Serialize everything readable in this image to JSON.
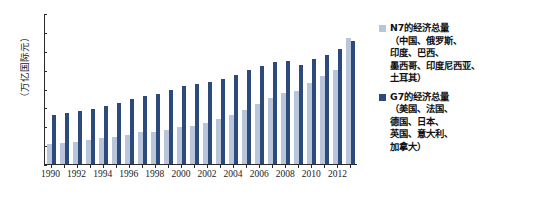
{
  "chart_data": {
    "type": "bar",
    "title": "",
    "xlabel": "",
    "ylabel": "（万亿国际元）",
    "ylim": [
      0,
      4.0
    ],
    "yticks": [
      "0",
      "0.5",
      "1.0",
      "1.5",
      "2.0",
      "2.5",
      "3.0",
      "3.5",
      "4.0"
    ],
    "ytick_values": [
      0,
      0.5,
      1.0,
      1.5,
      2.0,
      2.5,
      3.0,
      3.5,
      4.0
    ],
    "grid": false,
    "legend_position": "right",
    "categories": [
      "1990",
      "1991",
      "1992",
      "1993",
      "1994",
      "1995",
      "1996",
      "1997",
      "1998",
      "1999",
      "2000",
      "2001",
      "2002",
      "2003",
      "2004",
      "2005",
      "2006",
      "2007",
      "2008",
      "2009",
      "2010",
      "2011",
      "2012",
      "2013"
    ],
    "xtick_labels": [
      "1990",
      "1992",
      "1994",
      "1996",
      "1998",
      "2000",
      "2002",
      "2004",
      "2006",
      "2008",
      "2010",
      "2012"
    ],
    "series": [
      {
        "name": "N7的经济总量",
        "color": "#b9c5da",
        "values": [
          0.54,
          0.56,
          0.58,
          0.63,
          0.68,
          0.72,
          0.78,
          0.84,
          0.86,
          0.9,
          0.97,
          1.02,
          1.09,
          1.18,
          1.3,
          1.43,
          1.59,
          1.76,
          1.88,
          1.94,
          2.15,
          2.32,
          2.48,
          3.35
        ]
      },
      {
        "name": "G7的经济总量",
        "color": "#2c4a7c",
        "values": [
          1.3,
          1.35,
          1.41,
          1.46,
          1.54,
          1.62,
          1.71,
          1.79,
          1.86,
          1.95,
          2.07,
          2.12,
          2.18,
          2.25,
          2.37,
          2.48,
          2.6,
          2.71,
          2.73,
          2.62,
          2.78,
          2.9,
          3.05,
          3.27
        ]
      }
    ]
  },
  "legend": {
    "entries": [
      {
        "marker_name": "legend-swatch-n7",
        "title": "N7的经济总量",
        "detail": "（中国、俄罗斯、\n印度、巴西、\n墨西哥、印度尼西亚、\n土耳其）"
      },
      {
        "marker_name": "legend-swatch-g7",
        "title": "G7的经济总量",
        "detail": "（美国、法国、\n德国、日本、\n英国、意大利、\n加拿大）"
      }
    ]
  }
}
